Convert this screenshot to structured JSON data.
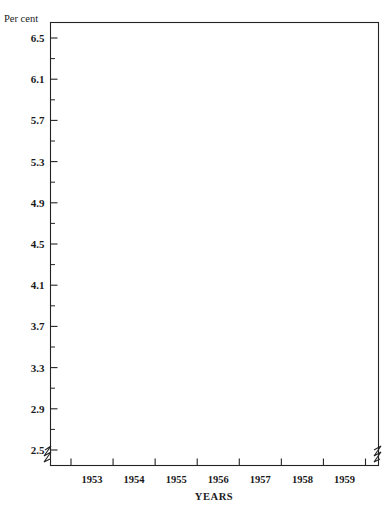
{
  "chart_data": {
    "type": "line",
    "title": "",
    "subtitle": "",
    "xlabel": "YEARS",
    "ylabel": "Per cent",
    "ylim": [
      2.5,
      6.7
    ],
    "xlim": [
      1952.5,
      1960.05
    ],
    "grid": false,
    "legend_position": "inline-annotations",
    "y_unit_label": "Per cent",
    "y_ticks": [
      2.5,
      2.9,
      3.3,
      3.7,
      4.1,
      4.5,
      4.9,
      5.3,
      5.7,
      6.1,
      6.5
    ],
    "y_tick_labels": [
      "2.5",
      "2.9",
      "3.3",
      "3.7",
      "4.1",
      "4.5",
      "4.9",
      "5.3",
      "5.7",
      "6.1",
      "6.5"
    ],
    "y_minor_ticks": [
      2.7,
      3.1,
      3.5,
      3.9,
      4.3,
      4.7,
      5.1,
      5.5,
      5.9,
      6.3
    ],
    "axis_break": true,
    "axis_break_note": "y-axis broken below 2.5",
    "x_ticks": [
      1953,
      1954,
      1955,
      1956,
      1957,
      1958,
      1959,
      1960
    ],
    "x_tick_labels": [
      "1953",
      "1954",
      "1955",
      "1956",
      "1957",
      "1958",
      "1959"
    ],
    "x_label_positions": [
      1953.5,
      1954.5,
      1955.5,
      1956.5,
      1957.5,
      1958.5,
      1959.5
    ],
    "annotations": [
      {
        "id": "conventional-mortgages",
        "lines": [
          "Average quarterly yields",
          "conventional mortgages"
        ],
        "x": 1957.05,
        "y": 6.33
      },
      {
        "id": "fha-mortgages",
        "lines": [
          "Average monthly yields",
          "FHA mortgages"
        ],
        "x": 1954.55,
        "y": 5.14
      },
      {
        "id": "corporate-bonds",
        "lines": [
          "Average monthly yields",
          "corporate bonds"
        ],
        "x": 1954.45,
        "y": 3.69
      },
      {
        "id": "government-bonds",
        "lines": [
          "Average monthly yields",
          "long-term U.S.",
          "government bonds"
        ],
        "x": 1957.95,
        "y": 3.0
      }
    ],
    "series": [
      {
        "name": "Average quarterly yields conventional mortgages",
        "frequency": "quarterly",
        "color": "#111111",
        "x": [
          1956.45,
          1956.62,
          1956.78,
          1956.95,
          1957.12,
          1957.3,
          1957.45,
          1957.6,
          1957.78,
          1957.95,
          1958.12,
          1958.3,
          1958.5,
          1958.7,
          1958.88,
          1959.05,
          1959.22,
          1959.4,
          1959.55,
          1959.7,
          1959.82,
          1959.92,
          1960.0
        ],
        "values": [
          5.67,
          5.78,
          5.86,
          5.93,
          5.98,
          6.05,
          6.12,
          6.1,
          5.93,
          5.8,
          5.72,
          5.68,
          5.74,
          5.82,
          5.87,
          5.92,
          5.99,
          6.1,
          6.22,
          6.3,
          6.36,
          6.37,
          6.35
        ]
      },
      {
        "name": "Average monthly yields FHA mortgages",
        "frequency": "monthly",
        "color": "#111111",
        "x": [
          1952.62,
          1952.7,
          1952.78,
          1952.87,
          1952.95,
          1953.04,
          1953.12,
          1953.21,
          1953.29,
          1953.37,
          1953.46,
          1953.54,
          1953.62,
          1953.71,
          1953.79,
          1953.87,
          1953.96,
          1954.04,
          1954.12,
          1954.21,
          1954.29,
          1954.37,
          1954.46,
          1954.54,
          1954.62,
          1954.71,
          1954.79,
          1954.87,
          1954.96,
          1955.04,
          1955.12,
          1955.21,
          1955.29,
          1955.37,
          1955.46,
          1955.54,
          1955.62,
          1955.71,
          1955.79,
          1955.87,
          1955.96,
          1956.04,
          1956.12,
          1956.21,
          1956.29,
          1956.37,
          1956.46,
          1956.54,
          1956.62,
          1956.71,
          1956.79,
          1956.87,
          1956.96,
          1957.04,
          1957.12,
          1957.21,
          1957.29,
          1957.37,
          1957.46,
          1957.54,
          1957.62,
          1957.71,
          1957.79,
          1957.87,
          1957.96,
          1958.04,
          1958.12,
          1958.21,
          1958.29,
          1958.37,
          1958.46,
          1958.54,
          1958.62,
          1958.71,
          1958.79,
          1958.87,
          1958.96,
          1959.04,
          1959.12,
          1959.21,
          1959.29,
          1959.37,
          1959.46,
          1959.54,
          1959.62,
          1959.71,
          1959.79,
          1959.87,
          1959.96
        ],
        "values": [
          4.5,
          4.56,
          4.62,
          4.66,
          4.7,
          4.74,
          4.8,
          4.87,
          4.9,
          4.88,
          4.84,
          4.82,
          4.8,
          4.74,
          4.7,
          4.67,
          4.66,
          4.65,
          4.64,
          4.64,
          4.63,
          4.63,
          4.64,
          4.63,
          4.63,
          4.64,
          4.65,
          4.66,
          4.67,
          4.68,
          4.68,
          4.69,
          4.71,
          4.73,
          4.75,
          4.76,
          4.74,
          4.73,
          4.74,
          4.77,
          4.8,
          4.83,
          4.86,
          4.88,
          4.9,
          4.94,
          5.0,
          5.12,
          5.22,
          5.3,
          5.33,
          5.35,
          5.4,
          5.5,
          5.58,
          5.64,
          5.68,
          5.66,
          5.6,
          5.54,
          5.46,
          5.38,
          5.32,
          5.3,
          5.32,
          5.34,
          5.38,
          5.42,
          5.44,
          5.43,
          5.42,
          5.44,
          5.5,
          5.58,
          5.68,
          5.78,
          5.86,
          5.93,
          6.0,
          6.08,
          6.16,
          6.22,
          6.28,
          6.32,
          6.3,
          6.26,
          6.24,
          6.22,
          6.2
        ]
      },
      {
        "name": "Average monthly yields corporate bonds",
        "frequency": "monthly",
        "color": "#111111",
        "x": [
          1952.54,
          1952.62,
          1952.7,
          1952.79,
          1952.87,
          1952.96,
          1953.04,
          1953.12,
          1953.21,
          1953.29,
          1953.37,
          1953.46,
          1953.54,
          1953.62,
          1953.71,
          1953.79,
          1953.87,
          1953.96,
          1954.04,
          1954.12,
          1954.21,
          1954.29,
          1954.37,
          1954.46,
          1954.54,
          1954.62,
          1954.71,
          1954.79,
          1954.87,
          1954.96,
          1955.04,
          1955.12,
          1955.21,
          1955.29,
          1955.37,
          1955.46,
          1955.54,
          1955.62,
          1955.71,
          1955.79,
          1955.87,
          1955.96,
          1956.04,
          1956.12,
          1956.21,
          1956.29,
          1956.37,
          1956.46,
          1956.54,
          1956.62,
          1956.71,
          1956.79,
          1956.87,
          1956.96,
          1957.04,
          1957.12,
          1957.21,
          1957.29,
          1957.37,
          1957.46,
          1957.54,
          1957.62,
          1957.71,
          1957.79,
          1957.87,
          1957.96,
          1958.04,
          1958.12,
          1958.21,
          1958.29,
          1958.37,
          1958.46,
          1958.54,
          1958.62,
          1958.71,
          1958.79,
          1958.87,
          1958.96,
          1959.04,
          1959.12,
          1959.21,
          1959.29,
          1959.37,
          1959.46,
          1959.54,
          1959.62,
          1959.71,
          1959.79,
          1959.87,
          1959.96
        ],
        "values": [
          3.17,
          3.21,
          3.22,
          3.21,
          3.23,
          3.24,
          3.27,
          3.33,
          3.4,
          3.48,
          3.56,
          3.62,
          3.58,
          3.6,
          3.52,
          3.47,
          3.43,
          3.4,
          3.36,
          3.33,
          3.3,
          3.24,
          3.21,
          3.2,
          3.2,
          3.21,
          3.2,
          3.19,
          3.19,
          3.2,
          3.19,
          3.19,
          3.2,
          3.21,
          3.23,
          3.25,
          3.26,
          3.27,
          3.28,
          3.3,
          3.31,
          3.3,
          3.32,
          3.34,
          3.4,
          3.48,
          3.55,
          3.62,
          3.7,
          3.75,
          3.78,
          3.82,
          3.84,
          3.88,
          3.94,
          4.0,
          4.08,
          4.14,
          4.18,
          4.2,
          4.16,
          4.1,
          4.02,
          3.94,
          3.88,
          3.86,
          3.83,
          3.8,
          3.78,
          3.8,
          3.86,
          3.9,
          3.94,
          3.98,
          4.02,
          4.08,
          4.12,
          4.16,
          4.2,
          4.26,
          4.32,
          4.3,
          4.36,
          4.4,
          4.36,
          4.4,
          4.44,
          4.42,
          4.38,
          4.34
        ],
        "values_note": "corporate bond yields, per cent"
      },
      {
        "name": "Average monthly yields long-term U.S. government bonds",
        "frequency": "monthly",
        "color": "#111111",
        "x": [
          1952.54,
          1952.62,
          1952.7,
          1952.79,
          1952.87,
          1952.96,
          1953.04,
          1953.12,
          1953.21,
          1953.29,
          1953.37,
          1953.46,
          1953.54,
          1953.62,
          1953.71,
          1953.79,
          1953.87,
          1953.96,
          1954.04,
          1954.12,
          1954.21,
          1954.29,
          1954.37,
          1954.46,
          1954.54,
          1954.62,
          1954.71,
          1954.79,
          1954.87,
          1954.96,
          1955.04,
          1955.12,
          1955.21,
          1955.29,
          1955.37,
          1955.46,
          1955.54,
          1955.62,
          1955.71,
          1955.79,
          1955.87,
          1955.96,
          1956.04,
          1956.12,
          1956.21,
          1956.29,
          1956.37,
          1956.46,
          1956.54,
          1956.62,
          1956.71,
          1956.79,
          1956.87,
          1956.96,
          1957.04,
          1957.12,
          1957.21,
          1957.29,
          1957.37,
          1957.46,
          1957.54,
          1957.62,
          1957.71,
          1957.79,
          1957.87,
          1957.96,
          1958.04,
          1958.12,
          1958.21,
          1958.29,
          1958.37,
          1958.46,
          1958.54,
          1958.62,
          1958.71,
          1958.79,
          1958.87,
          1958.96,
          1959.04,
          1959.12,
          1959.21,
          1959.29,
          1959.37,
          1959.46,
          1959.54,
          1959.62,
          1959.71,
          1959.79,
          1959.87,
          1959.96
        ],
        "values": [
          2.57,
          2.62,
          2.7,
          2.72,
          2.71,
          2.74,
          2.8,
          2.86,
          2.9,
          2.98,
          3.06,
          3.11,
          3.07,
          3.09,
          3.02,
          2.96,
          2.92,
          2.88,
          2.82,
          2.76,
          2.7,
          2.62,
          2.56,
          2.52,
          2.55,
          2.54,
          2.5,
          2.53,
          2.54,
          2.52,
          2.57,
          2.66,
          2.74,
          2.8,
          2.84,
          2.88,
          2.92,
          2.88,
          2.9,
          2.92,
          2.9,
          2.88,
          2.9,
          2.94,
          2.98,
          3.02,
          3.06,
          3.12,
          3.2,
          3.26,
          3.23,
          3.16,
          3.22,
          3.3,
          3.34,
          3.36,
          3.4,
          3.46,
          3.5,
          3.44,
          3.36,
          3.3,
          3.22,
          3.16,
          3.14,
          3.16,
          3.1,
          3.02,
          2.94,
          2.88,
          2.92,
          3.0,
          3.1,
          3.2,
          3.3,
          3.4,
          3.5,
          3.58,
          3.66,
          3.74,
          3.8,
          3.86,
          3.9,
          3.94,
          4.0,
          4.08,
          4.14,
          4.1,
          4.06,
          4.08
        ],
        "values_note": "long-term U.S. government bond yields, per cent"
      }
    ]
  }
}
